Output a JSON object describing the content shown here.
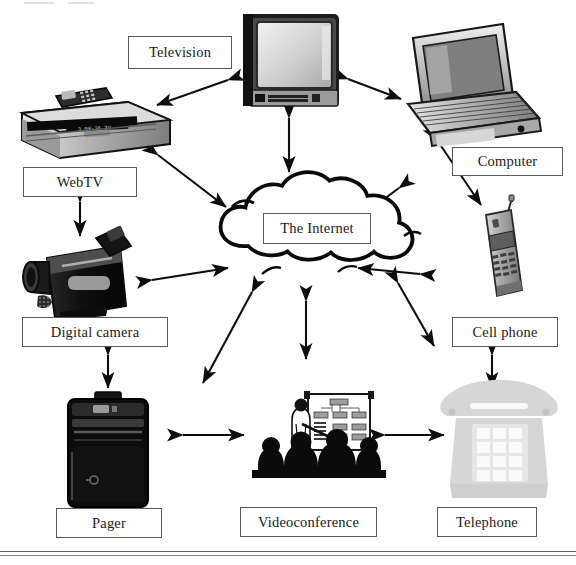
{
  "diagram": {
    "center": {
      "id": "internet",
      "label": "The Internet",
      "icon": "cloud-icon"
    },
    "nodes": [
      {
        "id": "television",
        "label": "Television",
        "icon": "television-icon",
        "box": {
          "x": 128,
          "y": 36,
          "w": 104,
          "h": 33
        }
      },
      {
        "id": "computer",
        "label": "Computer",
        "icon": "laptop-computer-icon",
        "box": {
          "x": 452,
          "y": 147,
          "w": 111,
          "h": 29
        }
      },
      {
        "id": "webtv",
        "label": "WebTV",
        "icon": "webtv-set-top-box-icon",
        "box": {
          "x": 23,
          "y": 167,
          "w": 114,
          "h": 30
        }
      },
      {
        "id": "cellphone",
        "label": "Cell phone",
        "icon": "cell-phone-icon",
        "box": {
          "x": 452,
          "y": 317,
          "w": 106,
          "h": 30
        }
      },
      {
        "id": "digitalcamera",
        "label": "Digital camera",
        "icon": "camcorder-icon",
        "box": {
          "x": 22,
          "y": 317,
          "w": 146,
          "h": 30
        }
      },
      {
        "id": "pager",
        "label": "Pager",
        "icon": "pager-icon",
        "box": {
          "x": 56,
          "y": 508,
          "w": 106,
          "h": 30
        }
      },
      {
        "id": "videoconference",
        "label": "Videoconference",
        "icon": "videoconference-icon",
        "box": {
          "x": 240,
          "y": 507,
          "w": 137,
          "h": 30
        }
      },
      {
        "id": "telephone",
        "label": "Telephone",
        "icon": "desk-telephone-icon",
        "box": {
          "x": 437,
          "y": 507,
          "w": 100,
          "h": 30
        }
      }
    ],
    "connections": [
      {
        "from": "television",
        "to": "internet",
        "style": "double-arrow"
      },
      {
        "from": "television",
        "to": "computer",
        "style": "double-arrow"
      },
      {
        "from": "television",
        "to": "webtv",
        "style": "double-arrow"
      },
      {
        "from": "webtv",
        "to": "internet",
        "style": "double-arrow"
      },
      {
        "from": "webtv",
        "to": "digitalcamera",
        "style": "double-arrow"
      },
      {
        "from": "digitalcamera",
        "to": "internet",
        "style": "double-arrow"
      },
      {
        "from": "digitalcamera",
        "to": "pager",
        "style": "double-arrow"
      },
      {
        "from": "pager",
        "to": "videoconference",
        "style": "double-arrow"
      },
      {
        "from": "videoconference",
        "to": "internet",
        "style": "double-arrow"
      },
      {
        "from": "videoconference",
        "to": "telephone",
        "style": "double-arrow"
      },
      {
        "from": "telephone",
        "to": "cellphone",
        "style": "double-arrow"
      },
      {
        "from": "cellphone",
        "to": "internet",
        "style": "double-arrow"
      },
      {
        "from": "computer",
        "to": "internet",
        "style": "double-arrow"
      },
      {
        "from": "computer",
        "to": "cellphone",
        "style": "double-arrow"
      }
    ],
    "colors": {
      "ink": "#111111",
      "box_border": "#5a5a5a",
      "background": "#ffffff",
      "device_dark": "#1a1a1a",
      "device_mid": "#8e8e8e",
      "device_light": "#d8d8d8",
      "telephone_ghost": "#d5d5d5"
    }
  }
}
